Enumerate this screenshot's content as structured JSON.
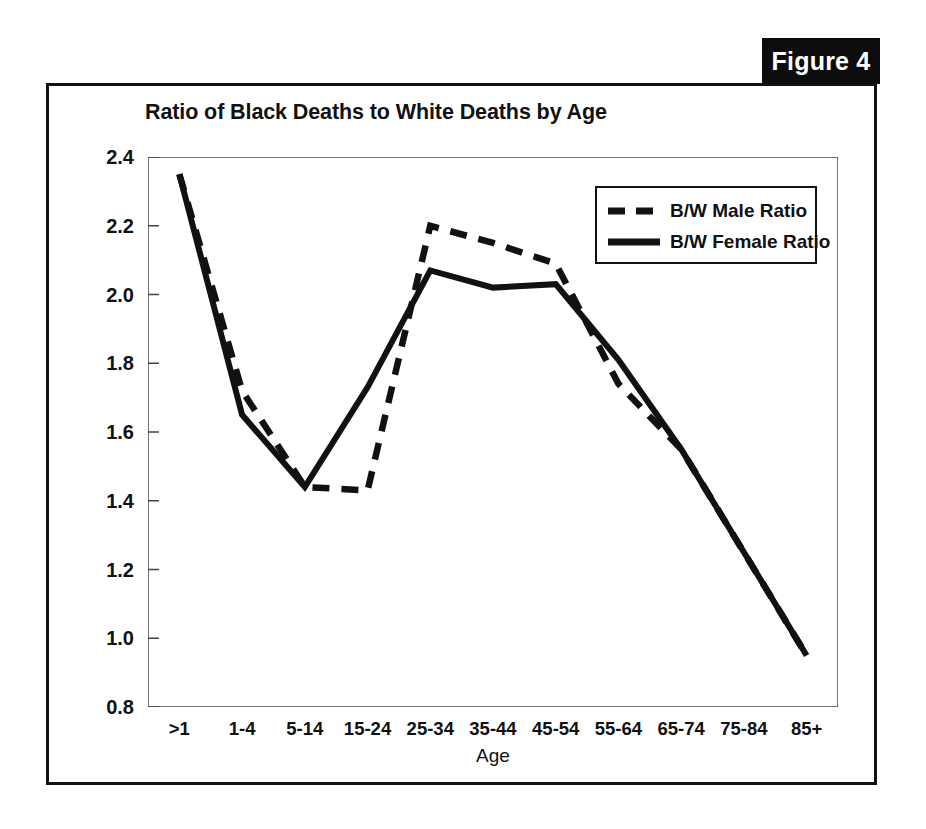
{
  "figure": {
    "tab_label": "Figure 4"
  },
  "chart_data": {
    "type": "line",
    "title": "Ratio of Black Deaths to White Deaths by Age",
    "xlabel": "Age",
    "ylabel": "",
    "categories": [
      ">1",
      "1-4",
      "5-14",
      "15-24",
      "25-34",
      "35-44",
      "45-54",
      "55-64",
      "65-74",
      "75-84",
      "85+"
    ],
    "ylim": [
      0.8,
      2.4
    ],
    "yticks": [
      "2.4",
      "2.2",
      "2.0",
      "1.8",
      "1.6",
      "1.4",
      "1.2",
      "1.0",
      "0.8"
    ],
    "ytick_values": [
      2.4,
      2.2,
      2.0,
      1.8,
      1.6,
      1.4,
      1.2,
      1.0,
      0.8
    ],
    "grid": false,
    "legend_position": "upper right",
    "series": [
      {
        "name": "B/W Male Ratio",
        "style": "dashed",
        "color": "#111111",
        "values": [
          2.35,
          1.72,
          1.44,
          1.43,
          2.2,
          2.15,
          2.09,
          1.74,
          1.55,
          1.25,
          0.95
        ]
      },
      {
        "name": "B/W Female Ratio",
        "style": "solid",
        "color": "#111111",
        "values": [
          2.35,
          1.65,
          1.44,
          1.73,
          2.07,
          2.02,
          2.03,
          1.81,
          1.55,
          1.25,
          0.95
        ]
      }
    ]
  }
}
